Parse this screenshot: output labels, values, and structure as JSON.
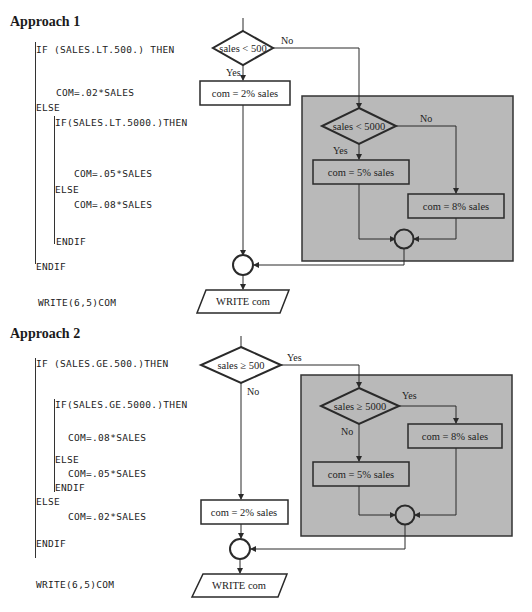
{
  "approach1": {
    "heading": "Approach 1",
    "code": {
      "if_outer": "IF (SALES.LT.500.) THEN",
      "com_02": "COM=.02*SALES",
      "else_outer": "ELSE",
      "if_inner": "IF(SALES.LT.5000.)THEN",
      "com_05": "COM=.05*SALES",
      "else_inner": "ELSE",
      "com_08": "COM=.08*SALES",
      "endif_inner": "ENDIF",
      "endif_outer": "ENDIF",
      "write": "WRITE(6,5)COM"
    },
    "flowchart": {
      "decision_outer": "sales < 500",
      "decision_outer_no": "No",
      "decision_outer_yes": "Yes",
      "box_2pct": "com  =  2% sales",
      "decision_inner": "sales < 5000",
      "decision_inner_no": "No",
      "decision_inner_yes": "Yes",
      "box_5pct": "com  =  5% sales",
      "box_8pct": "com  =  8% sales",
      "output": "WRITE com"
    }
  },
  "approach2": {
    "heading": "Approach 2",
    "code": {
      "if_outer": "IF (SALES.GE.500.)THEN",
      "if_inner": "IF(SALES.GE.5000.)THEN",
      "com_08": "COM=.08*SALES",
      "else_inner": "ELSE",
      "com_05": "COM=.05*SALES",
      "endif_inner": "ENDIF",
      "else_outer": "ELSE",
      "com_02": "COM=.02*SALES",
      "endif_outer": "ENDIF",
      "write": "WRITE(6,5)COM"
    },
    "flowchart": {
      "decision_outer": "sales ≥ 500",
      "decision_outer_yes": "Yes",
      "decision_outer_no": "No",
      "decision_inner": "sales ≥ 5000",
      "decision_inner_yes": "Yes",
      "decision_inner_no": "No",
      "box_8pct": "com  =  8% sales",
      "box_5pct": "com  =  5% sales",
      "box_2pct": "com  =  2% sales",
      "output": "WRITE com"
    }
  },
  "colors": {
    "panel_fill": "#b9b9b9",
    "stroke": "#2a2a2a"
  }
}
